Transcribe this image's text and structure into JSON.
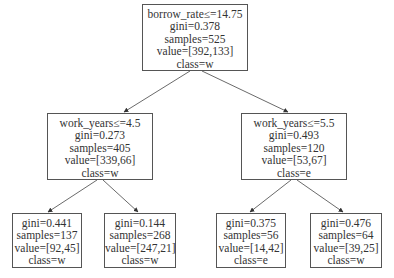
{
  "tree": {
    "root": {
      "condition": "borrow_rate≤=14.75",
      "gini": "gini=0.378",
      "samples": "samples=525",
      "value": "value=[392,133]",
      "class": "class=w"
    },
    "left": {
      "condition": "work_years≤=4.5",
      "gini": "gini=0.273",
      "samples": "samples=405",
      "value": "value=[339,66]",
      "class": "class=w"
    },
    "right": {
      "condition": "work_years≤=5.5",
      "gini": "gini=0.493",
      "samples": "samples=120",
      "value": "value=[53,67]",
      "class": "class=e"
    },
    "leaf_ll": {
      "gini": "gini=0.441",
      "samples": "samples=137",
      "value": "value=[92,45]",
      "class": "class=w"
    },
    "leaf_lr": {
      "gini": "gini=0.144",
      "samples": "samples=268",
      "value": "value=[247,21]",
      "class": "class=w"
    },
    "leaf_rl": {
      "gini": "gini=0.375",
      "samples": "samples=56",
      "value": "value=[14,42]",
      "class": "class=e"
    },
    "leaf_rr": {
      "gini": "gini=0.476",
      "samples": "samples=64",
      "value": "value=[39,25]",
      "class": "class=w"
    }
  },
  "colors": {
    "border": "#555555",
    "edge": "#444444",
    "text": "#333333"
  }
}
